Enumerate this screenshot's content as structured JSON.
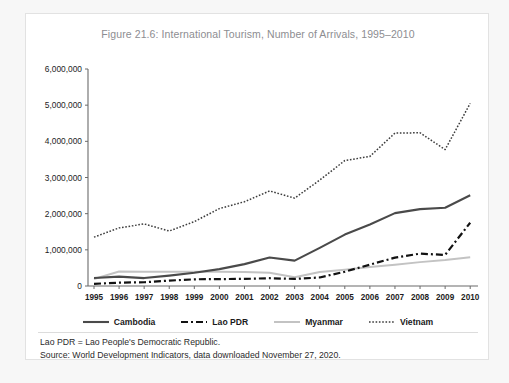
{
  "chart_data": {
    "type": "line",
    "title": "Figure 21.6: International Tourism, Number of Arrivals, 1995–2010",
    "xlabel": "",
    "ylabel": "",
    "categories": [
      "1995",
      "1996",
      "1997",
      "1998",
      "1999",
      "2000",
      "2001",
      "2002",
      "2003",
      "2004",
      "2005",
      "2006",
      "2007",
      "2008",
      "2009",
      "2010"
    ],
    "x": [
      1995,
      1996,
      1997,
      1998,
      1999,
      2000,
      2001,
      2002,
      2003,
      2004,
      2005,
      2006,
      2007,
      2008,
      2009,
      2010
    ],
    "ylim": [
      0,
      6000000
    ],
    "yticks": [
      0,
      1000000,
      2000000,
      3000000,
      4000000,
      5000000,
      6000000
    ],
    "ytick_labels": [
      "0",
      "1,000,000",
      "2,000,000",
      "3,000,000",
      "4,000,000",
      "5,000,000",
      "6,000,000"
    ],
    "grid": false,
    "legend_position": "bottom",
    "series": [
      {
        "name": "Cambodia",
        "style": "solid",
        "color": "#4a4a4a",
        "values": [
          220000,
          260000,
          219000,
          286000,
          368000,
          466000,
          605000,
          787000,
          701000,
          1055000,
          1422000,
          1700000,
          2015000,
          2125000,
          2162000,
          2508000
        ]
      },
      {
        "name": "Lao PDR",
        "style": "dash-dot",
        "color": "#121212",
        "values": [
          60000,
          93000,
          104000,
          150000,
          185000,
          191000,
          196000,
          215000,
          196000,
          236000,
          395000,
          590000,
          785000,
          895000,
          860000,
          1750000
        ]
      },
      {
        "name": "Myanmar",
        "style": "solid-light",
        "color": "#c3c3c3",
        "values": [
          194000,
          400000,
          397000,
          393000,
          392000,
          393000,
          384000,
          367000,
          242000,
          389000,
          450000,
          526000,
          590000,
          660000,
          718000,
          792000
        ]
      },
      {
        "name": "Vietnam",
        "style": "dotted",
        "color": "#3d3d3d",
        "values": [
          1351000,
          1607000,
          1716000,
          1520000,
          1781000,
          2140000,
          2330000,
          2628000,
          2429000,
          2928000,
          3468000,
          3583000,
          4229000,
          4236000,
          3772000,
          5050000
        ]
      }
    ],
    "notes": [
      "Lao PDR = Lao People's Democratic Republic.",
      "Source: World Development Indicators, data downloaded November 27, 2020."
    ]
  },
  "legend": {
    "items": [
      {
        "label": "Cambodia"
      },
      {
        "label": "Lao PDR"
      },
      {
        "label": "Myanmar"
      },
      {
        "label": "Vietnam"
      }
    ]
  }
}
